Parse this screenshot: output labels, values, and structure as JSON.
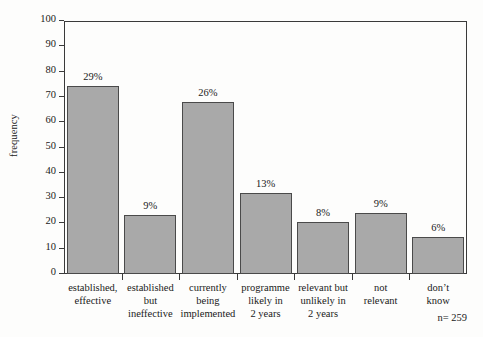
{
  "chart_data": {
    "type": "bar",
    "title": "",
    "xlabel": "",
    "ylabel": "frequency",
    "ylim": [
      0,
      100
    ],
    "yticks": [
      0,
      10,
      20,
      30,
      40,
      50,
      60,
      70,
      80,
      90,
      100
    ],
    "grid": false,
    "legend": "none",
    "bar_color": "#a9a9a9",
    "bar_edge_color": "#4a4a4a",
    "axis_color": "#3a3a3a",
    "categories": [
      "established,\neffective",
      "established\nbut\nineffective",
      "currently\nbeing\nimplemented",
      "programme\nlikely in\n2 years",
      "relevant but\nunlikely in\n2 years",
      "not\nrelevant",
      "don’t\nknow"
    ],
    "values": [
      74.5,
      23.2,
      68,
      32.2,
      20.7,
      24,
      14.7
    ],
    "data_labels": [
      "29%",
      "9%",
      "26%",
      "13%",
      "8%",
      "9%",
      "6%"
    ],
    "annotation": "n= 259",
    "sample_size": 259
  }
}
